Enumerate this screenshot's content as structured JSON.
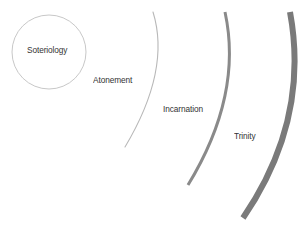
{
  "diagram": {
    "type": "concentric-arcs",
    "center": {
      "label": "Soteriology",
      "shape": "circle",
      "stroke_color": "#c8c8c8"
    },
    "rings": [
      {
        "label": "Atonement",
        "stroke_color": "#b8b8b8",
        "stroke_width": 1
      },
      {
        "label": "Incarnation",
        "stroke_color": "#8a8a8a",
        "stroke_width": 3
      },
      {
        "label": "Trinity",
        "stroke_color": "#7a7a7a",
        "stroke_width": 6
      }
    ]
  }
}
